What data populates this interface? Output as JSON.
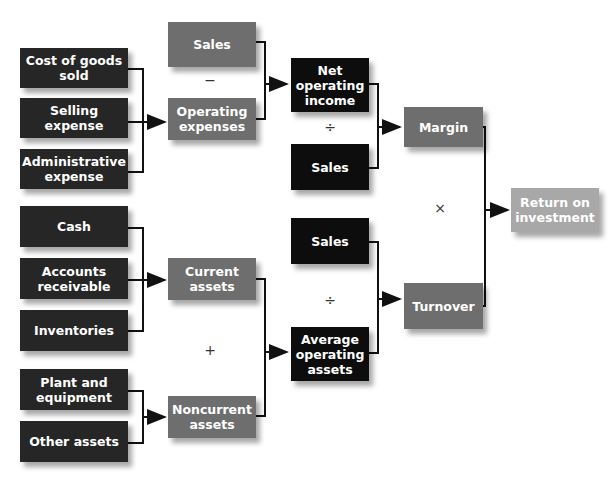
{
  "nodes": {
    "cogs": "Cost of goods sold",
    "selling": "Selling expense",
    "admin": "Administrative expense",
    "sales1": "Sales",
    "opex": "Operating expenses",
    "noi": "Net operating income",
    "sales2": "Sales",
    "margin": "Margin",
    "roi": "Return on investment",
    "cash": "Cash",
    "ar": "Accounts receivable",
    "inv": "Inventories",
    "plant": "Plant and equipment",
    "other": "Other assets",
    "current": "Current assets",
    "noncurrent": "Noncurrent assets",
    "sales3": "Sales",
    "avg": "Average operating assets",
    "turnover": "Turnover"
  },
  "operators": {
    "minus": "−",
    "divide1": "÷",
    "times": "×",
    "plus": "+",
    "divide2": "÷"
  }
}
